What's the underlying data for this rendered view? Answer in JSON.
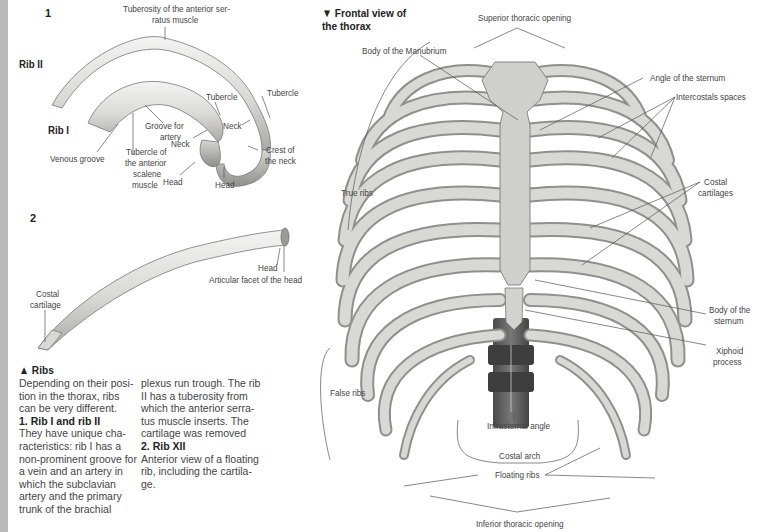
{
  "page": {
    "side_strip_color": "#b9b9b9"
  },
  "figure1": {
    "number": "1",
    "rib2_label": "Rib II",
    "rib1_label": "Rib I",
    "labels": {
      "tuberosity_line1": "Tuberosity of the anterior ser-",
      "tuberosity_line2": "ratus muscle",
      "tubercle_rib1": "Tubercle",
      "tubercle_rib2": "Tubercle",
      "groove_line1": "Groove for",
      "groove_line2": "artery",
      "neck_rib1": "Neck",
      "neck_rib2": "Neck",
      "venous_groove": "Venous groove",
      "scalene_line1": "Tubercle of",
      "scalene_line2": "the anterior",
      "scalene_line3": "scalene",
      "scalene_line4": "muscle",
      "head_rib1": "Head",
      "head_rib2": "Head",
      "crest_line1": "Crest of",
      "crest_line2": "the neck"
    }
  },
  "figure2": {
    "number": "2",
    "labels": {
      "head": "Head",
      "articular_facet": "Articular facet of the head",
      "costal_line1": "Costal",
      "costal_line2": "cartilage"
    }
  },
  "caption": {
    "title": "▲ Ribs",
    "col1": [
      {
        "text": "Depending on their posi-",
        "bold": false
      },
      {
        "text": "tion in the thorax, ribs",
        "bold": false
      },
      {
        "text": "can be very different.",
        "bold": false
      },
      {
        "text": "1. Rib I and rib II",
        "bold": true
      },
      {
        "text": "They have unique cha-",
        "bold": false
      },
      {
        "text": "racteristics: rib I has a",
        "bold": false
      },
      {
        "text": "non-prominent groove for",
        "bold": false
      },
      {
        "text": "a vein and an artery in",
        "bold": false
      },
      {
        "text": "which the subclavian",
        "bold": false
      },
      {
        "text": "artery and the primary",
        "bold": false
      },
      {
        "text": "trunk of the brachial",
        "bold": false
      }
    ],
    "col2": [
      {
        "text": "plexus run trough. The rib",
        "bold": false
      },
      {
        "text": "II has a tuberosity from",
        "bold": false
      },
      {
        "text": "which the anterior serra-",
        "bold": false
      },
      {
        "text": "tus muscle inserts. The",
        "bold": false
      },
      {
        "text": "cartilage was removed",
        "bold": false
      },
      {
        "text": "2. Rib XII",
        "bold": true
      },
      {
        "text": "Anterior view of a floating",
        "bold": false
      },
      {
        "text": "rib, including the cartila-",
        "bold": false
      },
      {
        "text": "ge.",
        "bold": false
      }
    ]
  },
  "thorax": {
    "heading_line1": "▼ Frontal view of",
    "heading_line2": "the thorax",
    "labels": {
      "superior_opening": "Superior thoracic opening",
      "manubrium": "Body of the Manubrium",
      "angle_sternum": "Angle of the sternum",
      "intercostal": "Intercostals spaces",
      "costal_line1": "Costal",
      "costal_line2": "cartilages",
      "true_ribs": "True ribs",
      "body_sternum_line1": "Body of the",
      "body_sternum_line2": "sternum",
      "xiphoid_line1": "Xiphoid",
      "xiphoid_line2": "process",
      "false_ribs": "False ribs",
      "infrasternal": "Infrasternal angle",
      "costal_arch": "Costal arch",
      "floating_ribs": "Floating ribs",
      "inferior_opening": "Inferior thoracic opening"
    }
  }
}
